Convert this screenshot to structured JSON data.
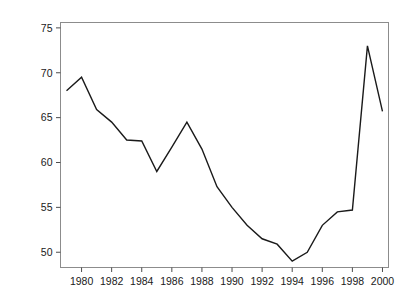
{
  "chart_data": {
    "type": "line",
    "title": "",
    "xlabel": "",
    "ylabel": "Trade (% of GDP)",
    "xlim": [
      1978.6,
      2000.4
    ],
    "ylim": [
      48.3,
      75.6
    ],
    "grid": false,
    "legend": "none",
    "x_ticks": [
      1980,
      1982,
      1984,
      1986,
      1988,
      1990,
      1992,
      1994,
      1996,
      1998,
      2000
    ],
    "x_tick_labels": [
      "1980",
      "1982",
      "1984",
      "1986",
      "1988",
      "1990",
      "1992",
      "1994",
      "1996",
      "1998",
      "2000"
    ],
    "y_ticks": [
      50,
      55,
      60,
      65,
      70,
      75
    ],
    "y_tick_labels": [
      "50",
      "55",
      "60",
      "65",
      "70",
      "75"
    ],
    "series": [
      {
        "name": "Trade (% of GDP)",
        "color": "#1a1a1a",
        "x": [
          1979,
          1980,
          1981,
          1982,
          1983,
          1984,
          1985,
          1986,
          1987,
          1988,
          1989,
          1990,
          1991,
          1992,
          1993,
          1994,
          1995,
          1996,
          1997,
          1998,
          1999,
          2000
        ],
        "values": [
          68.0,
          69.5,
          65.9,
          64.5,
          62.5,
          62.4,
          59.0,
          61.7,
          64.5,
          61.5,
          57.3,
          55.0,
          53.0,
          51.5,
          50.9,
          49.0,
          50.0,
          53.0,
          54.5,
          54.7,
          56.5,
          73.0
        ],
        "x_plot": [
          1979,
          1980,
          1981,
          1982,
          1983,
          1984,
          1985,
          1986,
          1987,
          1988,
          1989,
          1990,
          1991,
          1992,
          1993,
          1994,
          1995,
          1996,
          1997,
          1998,
          1999,
          2000
        ],
        "values_plot": [
          68.0,
          69.5,
          65.9,
          64.5,
          62.5,
          62.4,
          59.0,
          61.7,
          64.5,
          61.5,
          57.3,
          55.0,
          53.0,
          51.5,
          50.9,
          49.0,
          50.0,
          53.0,
          54.5,
          54.7,
          73.0,
          65.7
        ]
      }
    ],
    "annotations": []
  },
  "plot": {
    "background_color": "#ffffff",
    "frame_color": "#8c8c8c",
    "line_color": "#1a1a1a"
  }
}
